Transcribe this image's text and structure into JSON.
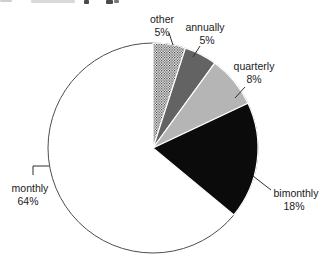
{
  "page": {
    "background": "#ffffff"
  },
  "artifacts": {
    "cropped_title_note": "unreadable text cut off at the top edge of the screenshot",
    "fragments": [
      {
        "x": 0,
        "y": 0,
        "w": 12,
        "h": 2,
        "color": "#cfcfcf"
      },
      {
        "x": 31,
        "y": 0,
        "w": 44,
        "h": 3,
        "color": "#d9d9d9"
      },
      {
        "x": 84,
        "y": 0,
        "w": 5,
        "h": 4,
        "color": "#4a4a4a"
      },
      {
        "x": 106,
        "y": 0,
        "w": 7,
        "h": 4,
        "color": "#4a4a4a"
      },
      {
        "x": 114,
        "y": 0,
        "w": 5,
        "h": 3,
        "color": "#7a7a7a"
      }
    ]
  },
  "chart_data": {
    "type": "pie",
    "title": "",
    "unit": "%",
    "direction": "clockwise",
    "start_angle_deg": 0,
    "center": {
      "x": 153,
      "y": 148
    },
    "radius": 105,
    "outline_color": "#4d4d4d",
    "separator_color": "#ffffff",
    "label_color": "#1a1a1a",
    "leader_color": "#2e2e2e",
    "categories": [
      "other",
      "annually",
      "quarterly",
      "bimonthly",
      "monthly"
    ],
    "values": [
      5,
      5,
      8,
      18,
      64
    ],
    "slices": [
      {
        "label": "other",
        "value": 5,
        "display": "5%",
        "fill": "dots-pattern",
        "label_lines": [
          {
            "text": "other",
            "x": 162,
            "y": 23
          },
          {
            "text": "5%",
            "x": 162,
            "y": 36
          }
        ],
        "leader": [
          [
            169,
            33
          ],
          [
            173,
            45
          ]
        ]
      },
      {
        "label": "annually",
        "value": 5,
        "display": "5%",
        "fill": "#636363",
        "label_lines": [
          {
            "text": "annually",
            "x": 205,
            "y": 31
          },
          {
            "text": "5%",
            "x": 207,
            "y": 44
          }
        ],
        "leader": [
          [
            200,
            46
          ],
          [
            193,
            57
          ]
        ]
      },
      {
        "label": "quarterly",
        "value": 8,
        "display": "8%",
        "fill": "#b5b5b5",
        "label_lines": [
          {
            "text": "quarterly",
            "x": 254,
            "y": 70
          },
          {
            "text": "8%",
            "x": 254,
            "y": 83
          }
        ],
        "leader": [
          [
            245,
            87
          ],
          [
            235,
            98
          ]
        ]
      },
      {
        "label": "bimonthly",
        "value": 18,
        "display": "18%",
        "fill": "#0b0b0b",
        "label_lines": [
          {
            "text": "bimonthly",
            "x": 296,
            "y": 197
          },
          {
            "text": "18%",
            "x": 294,
            "y": 210
          }
        ],
        "leader": [
          [
            253,
            176
          ],
          [
            271,
            190
          ]
        ]
      },
      {
        "label": "monthly",
        "value": 64,
        "display": "64%",
        "fill": "#ffffff",
        "label_lines": [
          {
            "text": "monthly",
            "x": 30,
            "y": 192
          },
          {
            "text": "64%",
            "x": 28,
            "y": 205
          }
        ],
        "leader": [
          [
            49,
            166
          ],
          [
            33,
            166
          ],
          [
            33,
            175
          ]
        ]
      }
    ]
  }
}
